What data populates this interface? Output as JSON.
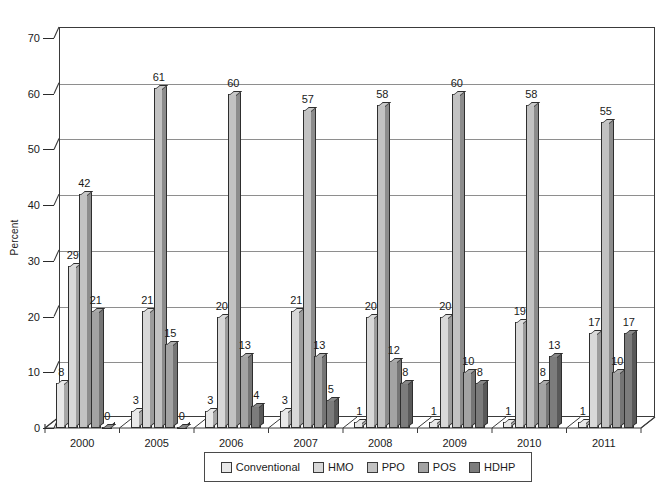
{
  "chart_data": {
    "type": "bar",
    "title": "",
    "xlabel": "",
    "ylabel": "Percent",
    "ylim": [
      0,
      70
    ],
    "ytick_step": 10,
    "yticks": [
      "0",
      "10",
      "20",
      "30",
      "40",
      "50",
      "60",
      "70"
    ],
    "grid": true,
    "legend_position": "bottom",
    "style": "3d-clustered-column",
    "categories": [
      "2000",
      "2005",
      "2006",
      "2007",
      "2008",
      "2009",
      "2010",
      "2011"
    ],
    "series": [
      {
        "name": "Conventional",
        "color": "#e8e8e8",
        "values": [
          8,
          3,
          3,
          3,
          1,
          1,
          1,
          1
        ]
      },
      {
        "name": "HMO",
        "color": "#d8d8d8",
        "values": [
          29,
          21,
          20,
          21,
          20,
          20,
          19,
          17
        ]
      },
      {
        "name": "PPO",
        "color": "#c2c2c2",
        "values": [
          42,
          61,
          60,
          57,
          58,
          60,
          58,
          55
        ]
      },
      {
        "name": "POS",
        "color": "#a3a3a3",
        "values": [
          21,
          15,
          13,
          13,
          12,
          10,
          8,
          10
        ]
      },
      {
        "name": "HDHP",
        "color": "#7c7c7c",
        "values": [
          0,
          0,
          4,
          5,
          8,
          8,
          13,
          17
        ]
      }
    ],
    "data_labels": [
      {
        "category": "2000",
        "values": [
          "8",
          "29",
          "42",
          "21",
          "0"
        ]
      },
      {
        "category": "2005",
        "values": [
          "3",
          "21",
          "61",
          "15",
          "0"
        ]
      },
      {
        "category": "2006",
        "values": [
          "3",
          "20",
          "60",
          "13",
          "4"
        ]
      },
      {
        "category": "2007",
        "values": [
          "3",
          "21",
          "57",
          "13",
          "5"
        ]
      },
      {
        "category": "2008",
        "values": [
          "1",
          "20",
          "58",
          "12",
          "8"
        ]
      },
      {
        "category": "2009",
        "values": [
          "1",
          "20",
          "60",
          "10",
          "8"
        ]
      },
      {
        "category": "2010",
        "values": [
          "1",
          "19",
          "58",
          "8",
          "13"
        ]
      },
      {
        "category": "2011",
        "values": [
          "1",
          "17",
          "55",
          "10",
          "17"
        ]
      }
    ]
  },
  "legend": {
    "items": [
      {
        "label": "Conventional",
        "color": "#e8e8e8"
      },
      {
        "label": "HMO",
        "color": "#d8d8d8"
      },
      {
        "label": "PPO",
        "color": "#c2c2c2"
      },
      {
        "label": "POS",
        "color": "#a3a3a3"
      },
      {
        "label": "HDHP",
        "color": "#7c7c7c"
      }
    ]
  }
}
